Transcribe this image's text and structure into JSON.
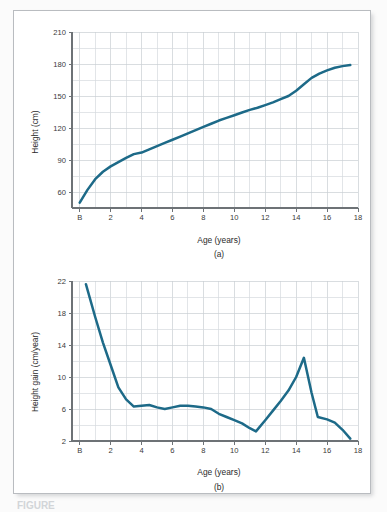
{
  "figure": {
    "caption": "FIGURE",
    "panel_a_letter": "(a)",
    "panel_b_letter": "(b)",
    "line_color": "#1d6a88",
    "grid_color": "#d6dade",
    "axis_color": "#6d7276",
    "frame_color": "#b9bcc0",
    "background": "#ffffff"
  },
  "chart_data": [
    {
      "id": "chart-a",
      "type": "line",
      "title": "",
      "panel_label": "(a)",
      "xlabel": "Age (years)",
      "ylabel": "Height (cm)",
      "xlim": [
        -0.5,
        18
      ],
      "ylim": [
        45,
        210
      ],
      "grid": true,
      "legend": "none",
      "x_ticks": [
        0,
        2,
        4,
        6,
        8,
        10,
        12,
        14,
        16,
        18
      ],
      "x_tick_labels": [
        "B",
        "2",
        "4",
        "6",
        "8",
        "10",
        "12",
        "14",
        "16",
        "18"
      ],
      "x_minor_step": 1,
      "y_ticks": [
        60,
        90,
        120,
        150,
        180,
        210
      ],
      "y_tick_labels": [
        "60",
        "90",
        "120",
        "150",
        "180",
        "210"
      ],
      "y_minor_step": 15,
      "series": [
        {
          "name": "Height",
          "units": "cm",
          "x": [
            0,
            0.5,
            1,
            1.5,
            2,
            2.5,
            3,
            3.5,
            4,
            4.5,
            5,
            5.5,
            6,
            6.5,
            7,
            7.5,
            8,
            8.5,
            9,
            9.5,
            10,
            10.5,
            11,
            11.5,
            12,
            12.5,
            13,
            13.5,
            14,
            14.5,
            15,
            15.5,
            16,
            16.5,
            17,
            17.5
          ],
          "values": [
            50,
            62,
            72,
            79,
            84,
            88,
            92,
            95.5,
            97,
            100,
            103,
            106,
            109,
            112,
            115,
            118,
            121,
            124,
            127,
            129.5,
            132,
            134.5,
            137,
            139,
            141.5,
            144,
            147,
            150,
            155,
            161,
            167,
            171,
            174,
            176.5,
            178,
            179
          ]
        }
      ]
    },
    {
      "id": "chart-b",
      "type": "line",
      "title": "",
      "panel_label": "(b)",
      "xlabel": "Age (years)",
      "ylabel": "Height gain (cm/year)",
      "xlim": [
        -0.5,
        18
      ],
      "ylim": [
        2,
        22
      ],
      "grid": true,
      "legend": "none",
      "x_ticks": [
        0,
        2,
        4,
        6,
        8,
        10,
        12,
        14,
        16,
        18
      ],
      "x_tick_labels": [
        "B",
        "2",
        "4",
        "6",
        "8",
        "10",
        "12",
        "14",
        "16",
        "18"
      ],
      "x_minor_step": 1,
      "y_ticks": [
        2,
        6,
        10,
        14,
        18,
        22
      ],
      "y_tick_labels": [
        "2",
        "6",
        "10",
        "14",
        "18",
        "22"
      ],
      "y_minor_step": 2,
      "series": [
        {
          "name": "Height gain",
          "units": "cm/year",
          "x": [
            0.4,
            1,
            1.5,
            2,
            2.5,
            3,
            3.5,
            4,
            4.5,
            5,
            5.5,
            6,
            6.5,
            7,
            7.5,
            8,
            8.5,
            9,
            9.5,
            10,
            10.5,
            11,
            11.4,
            12,
            12.5,
            13,
            13.5,
            14,
            14.5,
            15,
            15.4,
            16,
            16.5,
            17,
            17.5
          ],
          "values": [
            21.6,
            17.5,
            14.3,
            11.5,
            8.7,
            7.2,
            6.3,
            6.4,
            6.5,
            6.2,
            6.0,
            6.2,
            6.4,
            6.4,
            6.3,
            6.2,
            6.0,
            5.4,
            5.0,
            4.6,
            4.2,
            3.6,
            3.2,
            4.6,
            5.8,
            7.0,
            8.3,
            10.0,
            12.4,
            8.0,
            5.0,
            4.7,
            4.3,
            3.4,
            2.3
          ]
        }
      ]
    }
  ]
}
